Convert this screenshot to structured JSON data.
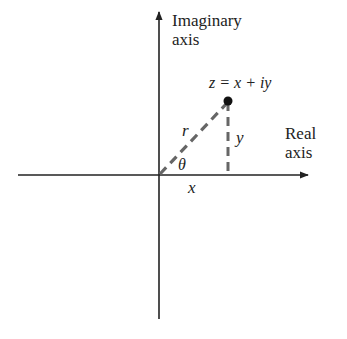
{
  "diagram": {
    "colors": {
      "axis": "#222222",
      "dashed": "#666666",
      "point": "#111111",
      "text": "#222222"
    },
    "axes": {
      "imaginary_label_line1": "Imaginary",
      "imaginary_label_line2": "axis",
      "real_label_line1": "Real",
      "real_label_line2": "axis"
    },
    "point": {
      "label": "z = x + iy"
    },
    "segments": {
      "r_label": "r",
      "y_label": "y",
      "x_label": "x",
      "angle_label": "θ"
    }
  }
}
